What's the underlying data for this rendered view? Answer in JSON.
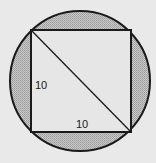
{
  "diagram": {
    "shapes": [
      "circle",
      "inscribed-square",
      "diagonal"
    ],
    "labels": {
      "left_side": "10",
      "bottom_side": "10"
    },
    "colors": {
      "background": "#e9e9e9",
      "stroke": "#1a1a1a",
      "square_fill": "#e6e6e6",
      "shaded_region": "#b8b8b8"
    }
  }
}
